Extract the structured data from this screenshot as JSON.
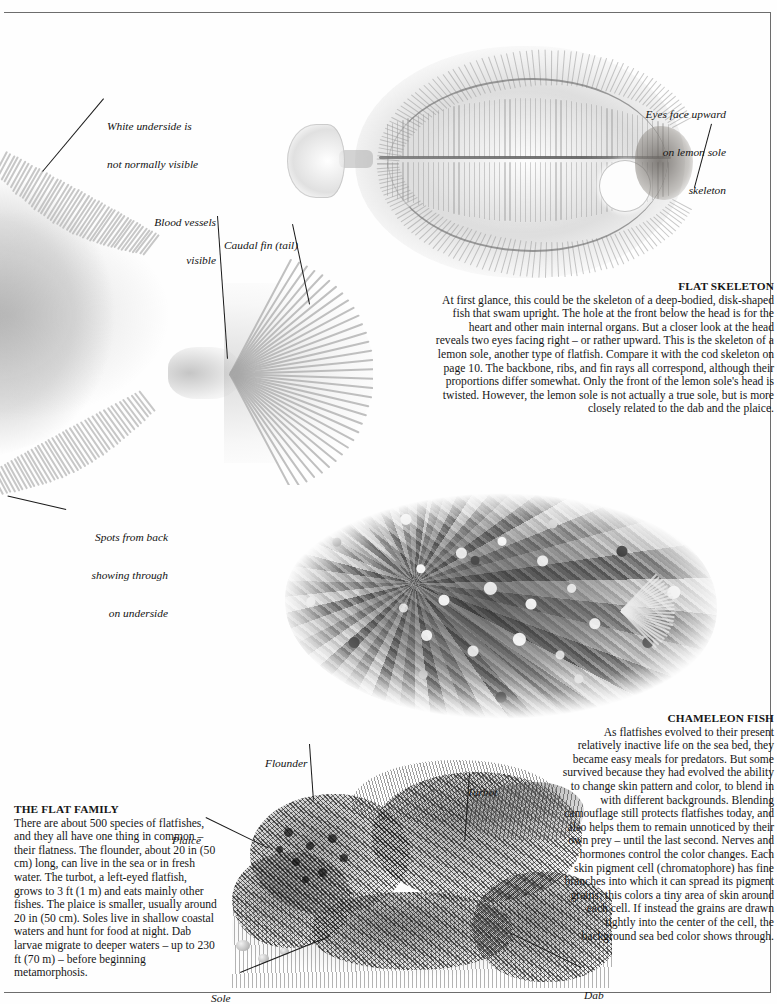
{
  "page": {
    "background_color": "#fefefe",
    "rule_color": "#6d6d6d"
  },
  "callouts": [
    {
      "name": "white-underside",
      "line1": "White underside is",
      "line2": "not normally visible",
      "align": "left"
    },
    {
      "name": "blood-vessels",
      "line1": "Blood vessels",
      "line2": "visible",
      "align": "right"
    },
    {
      "name": "caudal-fin",
      "line1": "Caudal fin (tail)",
      "line2": "",
      "align": "left"
    },
    {
      "name": "eyes-face-upward",
      "line1": "Eyes face upward",
      "line2": "on lemon sole",
      "line3": "skeleton",
      "align": "right"
    },
    {
      "name": "spots-from-back",
      "line1": "Spots from back",
      "line2": "showing through",
      "line3": "on underside",
      "align": "right"
    },
    {
      "name": "flounder",
      "line1": "Flounder",
      "align": "left"
    },
    {
      "name": "turbot",
      "line1": "Turbot",
      "align": "left"
    },
    {
      "name": "plaice",
      "line1": "Plaice",
      "align": "left"
    },
    {
      "name": "sole",
      "line1": "Sole",
      "align": "left"
    },
    {
      "name": "dab",
      "line1": "Dab",
      "align": "left"
    }
  ],
  "flat_skeleton": {
    "heading": "FLAT SKELETON",
    "body": "At first glance, this could be the skeleton of a deep-bodied, disk-shaped fish that swam upright. The hole at the front below the head is for the heart and other main internal organs. But a closer look at the head reveals two eyes facing right – or rather upward. This is the skeleton of a lemon sole, another type of flatfish. Compare it with the cod skeleton on page 10. The backbone, ribs, and fin rays all correspond, although their proportions differ somewhat. Only the front of the lemon sole's head is twisted. However, the lemon sole is not actually a true sole, but is more closely related to the dab and the plaice."
  },
  "chameleon_fish": {
    "heading": "CHAMELEON FISH",
    "body": "As flatfishes evolved to their present relatively inactive life on the sea bed, they became easy meals for predators. But some survived because they had evolved the ability to change skin pattern and color, to blend in with different backgrounds.  Blending camouflage still protects flatfishes today, and also helps them to remain unnoticed by their own prey – until the last second. Nerves and hormones control the color changes. Each skin pigment cell (chromatophore) has fine branches into which it can spread its pigment grains; this colors a tiny area of skin around each cell. If instead the grains are drawn tightly into the center of the cell, the background sea bed color shows through."
  },
  "flat_family": {
    "heading": "THE FLAT FAMILY",
    "body": "There are about 500 species of flatfishes, and they all have one thing in common – their flatness. The flounder, about 20 in (50 cm) long, can live in the sea or in fresh water. The turbot, a left-eyed flatfish, grows to 3 ft (1 m) and eats mainly other fishes. The plaice is smaller, usually around 20 in (50 cm). Soles live in shallow coastal waters and hunt for food at night. Dab larvae migrate to deeper waters – up to 230  ft (70 m) – before beginning metamorphosis."
  },
  "figures": {
    "skeleton_caption": "lemon sole skeleton photograph",
    "left_body_caption": "backlit flatfish underside photograph",
    "caudal_caption": "backlit caudal fin photograph",
    "camouflage_caption": "plaice camouflaged on gravel sea bed photograph",
    "engraving_caption": "engraving of flatfish species group"
  }
}
